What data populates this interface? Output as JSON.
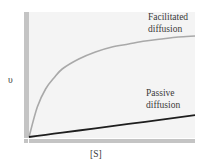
{
  "chart_data": {
    "type": "line",
    "title": "",
    "xlabel": "[S]",
    "ylabel": "υ",
    "xlim": [
      0,
      10
    ],
    "ylim": [
      0,
      1.25
    ],
    "grid": false,
    "legend": "inline labels at right end of curves",
    "x": [
      0,
      0.5,
      1,
      1.5,
      2,
      3,
      4,
      5,
      6,
      7,
      8,
      9,
      10
    ],
    "series": [
      {
        "name": "Facilitated diffusion",
        "label_lines": [
          "Facilitated",
          "diffusion"
        ],
        "color": "#a9a9a9",
        "shape": "hyperbolic (saturating)",
        "values": [
          0,
          0.3,
          0.48,
          0.59,
          0.68,
          0.78,
          0.85,
          0.9,
          0.93,
          0.96,
          0.98,
          1.0,
          1.01
        ]
      },
      {
        "name": "Passive diffusion",
        "label_lines": [
          "Passive",
          "diffusion"
        ],
        "color": "#1e1e1e",
        "shape": "linear",
        "values": [
          0,
          0.011,
          0.022,
          0.033,
          0.044,
          0.065,
          0.087,
          0.109,
          0.131,
          0.152,
          0.174,
          0.196,
          0.218
        ]
      }
    ]
  },
  "colors": {
    "plot_background": "#f4f4f4",
    "axis_bar": "#c4c4c4",
    "facilitated": "#a9a9a9",
    "passive": "#1e1e1e",
    "text": "#3a3a3a"
  }
}
